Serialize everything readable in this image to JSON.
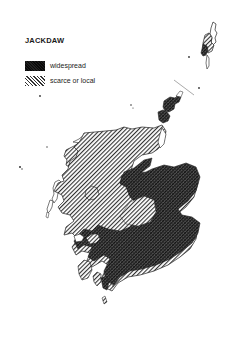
{
  "title": "JACKDAW",
  "legend": {
    "items": [
      {
        "key": "widespread",
        "label": "widespread",
        "pattern": "cross-hatch-dense"
      },
      {
        "key": "scarce",
        "label": "scarce or local",
        "pattern": "diagonal-hatch-light"
      }
    ]
  },
  "map": {
    "region": "Scotland",
    "colors": {
      "ink": "#1a1a1a",
      "dense_fill": "#4a4a4a",
      "light_fill": "#b5b5b5",
      "paper": "#ffffff"
    }
  }
}
